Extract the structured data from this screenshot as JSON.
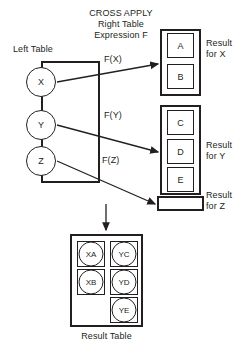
{
  "header": {
    "title": "CROSS APPLY\nRight Table\nExpression F"
  },
  "left_table": {
    "label": "Left Table",
    "rows": [
      {
        "value": "X"
      },
      {
        "value": "Y"
      },
      {
        "value": "Z"
      }
    ]
  },
  "arrows": [
    {
      "label": "F(X)"
    },
    {
      "label": "F(Y)"
    },
    {
      "label": "F(Z)"
    }
  ],
  "right_groups": [
    {
      "result_label": "Result\nfor X",
      "rows": [
        {
          "value": "A"
        },
        {
          "value": "B"
        }
      ]
    },
    {
      "result_label": "Result\nfor Y",
      "rows": [
        {
          "value": "C"
        },
        {
          "value": "D"
        },
        {
          "value": "E"
        }
      ]
    },
    {
      "result_label": "Result\nfor Z",
      "rows": []
    }
  ],
  "result_table": {
    "label": "Result Table",
    "cells": [
      {
        "value": "XA"
      },
      {
        "value": "YC"
      },
      {
        "value": "XB"
      },
      {
        "value": "YD"
      },
      {
        "value": "YE"
      }
    ]
  },
  "colors": {
    "stroke": "#231f20",
    "background": "#ffffff"
  }
}
